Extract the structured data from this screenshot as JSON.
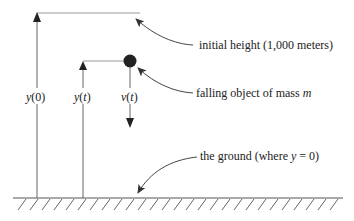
{
  "diagram": {
    "labels": {
      "initial_height": "initial height (1,000 meters)",
      "falling_object_prefix": "falling object of mass ",
      "falling_object_var": "m",
      "ground_prefix": "the ground (where ",
      "ground_var": "y",
      "ground_suffix": " = 0)",
      "y0_var": "y",
      "y0_arg": "(0)",
      "yt_var": "y",
      "yt_paren_open": "(",
      "yt_arg": "t",
      "yt_paren_close": ")",
      "vt_var": "v",
      "vt_paren_open": "(",
      "vt_arg": "t",
      "vt_paren_close": ")"
    },
    "colors": {
      "line": "#555555",
      "guide": "#999999",
      "ball": "#222222",
      "text": "#222222"
    }
  }
}
